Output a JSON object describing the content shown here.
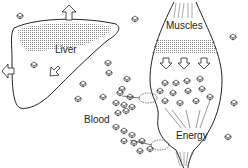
{
  "labels": {
    "liver": "Liver",
    "muscles": "Muscles",
    "blood": "Blood",
    "energy": "Energy"
  },
  "colors": {
    "stroke": "#222222",
    "shading": "#9a9a9a",
    "background": "#ffffff"
  }
}
